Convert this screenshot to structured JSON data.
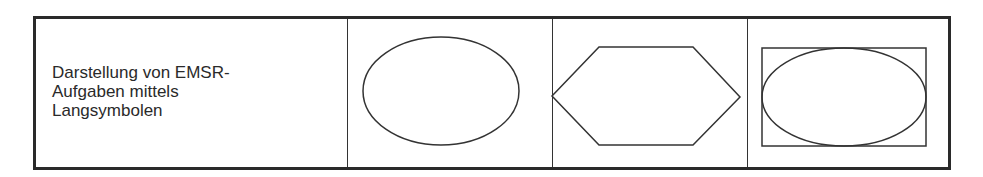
{
  "table": {
    "row": {
      "label": "Darstellung von EMSR-\nAufgaben mittels\nLangsymbolen",
      "symbols": [
        {
          "name": "ellipse-symbol",
          "shape": "ellipse"
        },
        {
          "name": "hexagon-symbol",
          "shape": "hexagon"
        },
        {
          "name": "ellipse-in-rectangle-symbol",
          "shape": "ellipse-in-rectangle"
        }
      ]
    }
  },
  "colors": {
    "line": "#333333",
    "border": "#2a2a2a",
    "background": "#ffffff"
  }
}
